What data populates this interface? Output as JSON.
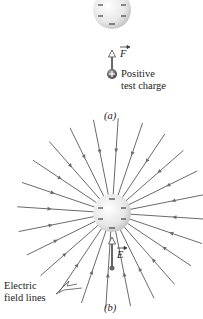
{
  "panel_a": {
    "caption": "(a)",
    "sphere": {
      "cx": 112,
      "cy": 10,
      "r": 19,
      "charge": "negative"
    },
    "force_label": "F",
    "test_charge_label_1": "Positive",
    "test_charge_label_2": "test charge",
    "test_charge_sign": "+"
  },
  "panel_b": {
    "caption": "(b)",
    "sphere": {
      "cx": 112,
      "cy": 213,
      "r": 19,
      "charge": "negative"
    },
    "field_vector_label": "E",
    "field_lines_label_1": "Electric",
    "field_lines_label_2": "field lines",
    "field_line_count": 24,
    "field_line_length": 95
  },
  "colors": {
    "line": "#6b6b6b",
    "sphere_light": "#f8f8f8",
    "sphere_dark": "#cfcfcf",
    "minus": "#444444"
  }
}
